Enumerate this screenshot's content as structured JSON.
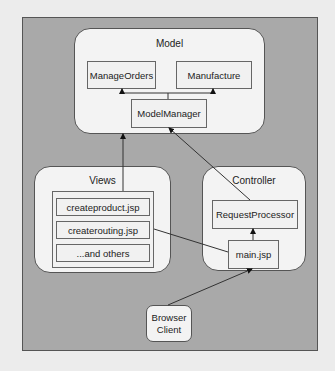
{
  "diagram": {
    "model": {
      "title": "Model",
      "components": [
        "ManageOrders",
        "Manufacture"
      ],
      "manager": "ModelManager"
    },
    "views": {
      "title": "Views",
      "items": [
        "createproduct.jsp",
        "createrouting.jsp",
        "...and others"
      ]
    },
    "controller": {
      "title": "Controller",
      "processor": "RequestProcessor",
      "entry": "main.jsp"
    },
    "client": {
      "line1": "Browser",
      "line2": "Client"
    },
    "colors": {
      "background": "#ececec",
      "outer_fill": "#a9a9a9",
      "group_fill": "#f3f3f3",
      "stroke": "#333333"
    }
  }
}
